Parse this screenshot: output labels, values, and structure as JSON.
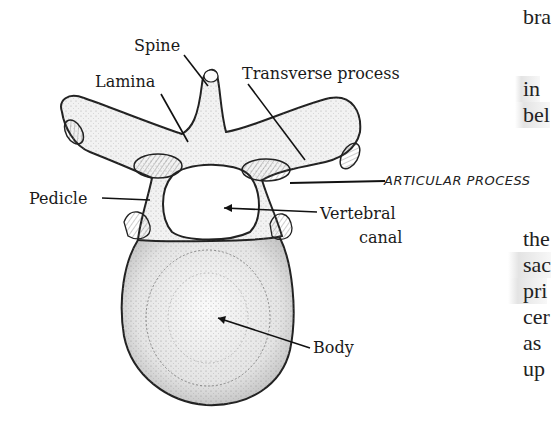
{
  "diagram": {
    "labels": {
      "spine": "Spine",
      "lamina": "Lamina",
      "transverse_process": "Transverse process",
      "pedicle": "Pedicle",
      "vertebral": "Vertebral",
      "canal": "canal",
      "body": "Body",
      "articular_process": "ARTICULAR PROCESS"
    }
  },
  "side_text": {
    "lines": [
      "bra",
      "in",
      "bel",
      "the",
      "sac",
      "pri",
      "cer",
      "as",
      "up"
    ]
  }
}
